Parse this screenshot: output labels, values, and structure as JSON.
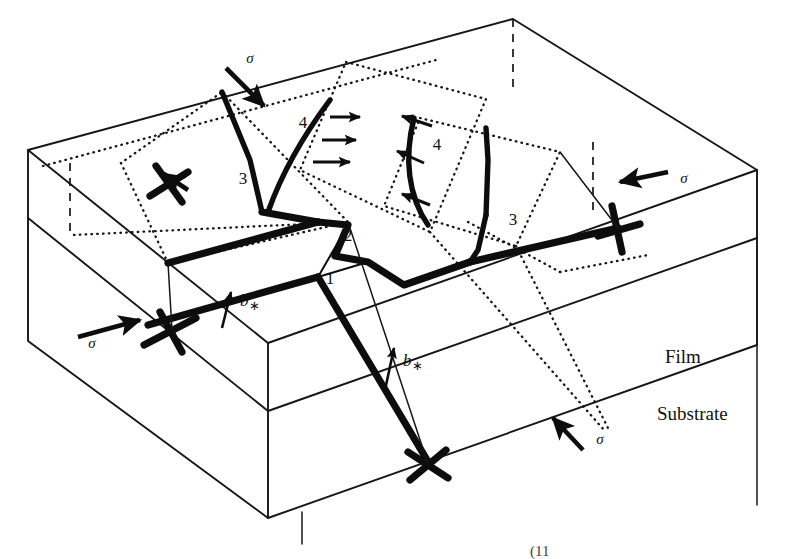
{
  "figure": {
    "background_color": "#ffffff",
    "ink_color": "#0d0d0d",
    "width": 786,
    "height": 559
  },
  "regions": [
    {
      "name": "film",
      "label": "Film"
    },
    {
      "name": "substrate",
      "label": "Substrate"
    }
  ],
  "stress_arrows": [
    {
      "id": "sigma-top-left",
      "label": "σ",
      "label_x": 250,
      "label_y": 63,
      "direction": "down-right"
    },
    {
      "id": "sigma-right",
      "label": "σ",
      "label_x": 684,
      "label_y": 183,
      "direction": "left"
    },
    {
      "id": "sigma-bottom-left",
      "label": "σ",
      "label_x": 92,
      "label_y": 348,
      "direction": "right"
    },
    {
      "id": "sigma-bottom-right",
      "label": "σ",
      "label_x": 600,
      "label_y": 444,
      "direction": "up-right"
    }
  ],
  "burgers_vectors": [
    {
      "id": "b-star-left",
      "label": "b",
      "subscript": "∗",
      "label_x": 240,
      "label_y": 306
    },
    {
      "id": "b-star-right",
      "label": "b",
      "subscript": "∗",
      "label_x": 403,
      "label_y": 366
    }
  ],
  "segment_labels": [
    {
      "id": "segment-1",
      "label": "1",
      "x": 330,
      "y": 284,
      "meaning": "misfit segment at interface"
    },
    {
      "id": "segment-2",
      "label": "2",
      "x": 348,
      "y": 241,
      "meaning": "bowing interface segment"
    },
    {
      "id": "segment-3-left",
      "label": "3",
      "x": 243,
      "y": 184,
      "meaning": "threading arm, left"
    },
    {
      "id": "segment-3-right",
      "label": "3",
      "x": 513,
      "y": 225,
      "meaning": "threading arm, right"
    },
    {
      "id": "segment-4-left",
      "label": "4",
      "x": 303,
      "y": 128,
      "meaning": "glide loop arm, left"
    },
    {
      "id": "segment-4-right",
      "label": "4",
      "x": 437,
      "y": 150,
      "meaning": "glide loop arm, right"
    }
  ],
  "glide_direction_arrows": {
    "left_group_count": 3,
    "left_group_direction": "right",
    "right_group_count": 3,
    "right_group_direction": "left"
  },
  "caption_fragment": "(11"
}
